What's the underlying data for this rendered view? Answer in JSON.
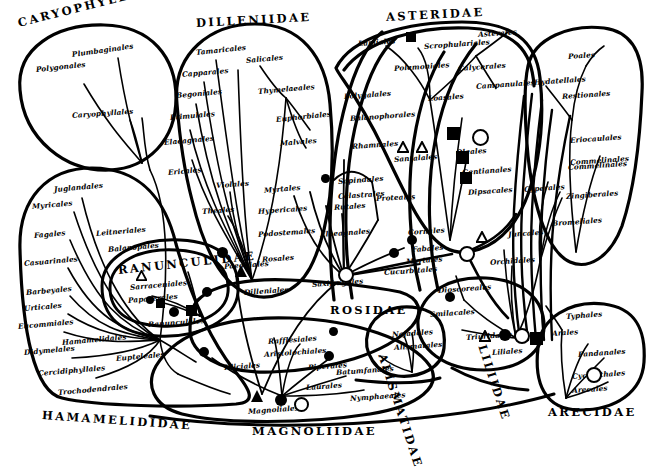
{
  "figure": {
    "type": "diagram",
    "kind": "phylogenetic-bubble-diagram",
    "background_color": "#ffffff",
    "ink_color": "#000000"
  },
  "subclasses": [
    {
      "label": "CARYOPHYLLIDAE",
      "x": 18,
      "y": 16,
      "rot": -14
    },
    {
      "label": "DILLENIIDAE",
      "x": 196,
      "y": 16,
      "rot": -3
    },
    {
      "label": "ASTERIDAE",
      "x": 386,
      "y": 10,
      "rot": -3
    },
    {
      "label": "RANUNCULIDAE",
      "x": 118,
      "y": 263,
      "rot": -6
    },
    {
      "label": "ROSIDAE",
      "x": 330,
      "y": 303,
      "rot": 0
    },
    {
      "label": "HAMAMELIDIDAE",
      "x": 42,
      "y": 408,
      "rot": 4
    },
    {
      "label": "MAGNOLIIDAE",
      "x": 252,
      "y": 424,
      "rot": 0
    },
    {
      "label": "ALISMATIDAE",
      "x": 382,
      "y": 347,
      "rot": 72
    },
    {
      "label": "LILIIDAE",
      "x": 482,
      "y": 338,
      "rot": 72
    },
    {
      "label": "ARECIDAE",
      "x": 548,
      "y": 405,
      "rot": 0
    }
  ],
  "orders": [
    {
      "label": "Plumbaginales",
      "x": 72,
      "y": 50,
      "rot": -8
    },
    {
      "label": "Polygonales",
      "x": 36,
      "y": 65,
      "rot": -6
    },
    {
      "label": "Caryophyllales",
      "x": 72,
      "y": 111,
      "rot": -4
    },
    {
      "label": "Tamaricales",
      "x": 196,
      "y": 48,
      "rot": -6
    },
    {
      "label": "Salicales",
      "x": 246,
      "y": 56,
      "rot": -5
    },
    {
      "label": "Capparales",
      "x": 182,
      "y": 70,
      "rot": -5
    },
    {
      "label": "Thymelaeales",
      "x": 258,
      "y": 87,
      "rot": -5
    },
    {
      "label": "Begoniales",
      "x": 176,
      "y": 91,
      "rot": -5
    },
    {
      "label": "Euphorbiales",
      "x": 276,
      "y": 115,
      "rot": -6
    },
    {
      "label": "Primulales",
      "x": 170,
      "y": 113,
      "rot": -5
    },
    {
      "label": "Malvales",
      "x": 280,
      "y": 139,
      "rot": -5
    },
    {
      "label": "Elaeagnales",
      "x": 164,
      "y": 138,
      "rot": -5
    },
    {
      "label": "Violales",
      "x": 216,
      "y": 181,
      "rot": -4
    },
    {
      "label": "Ericales",
      "x": 168,
      "y": 168,
      "rot": -5
    },
    {
      "label": "Theales",
      "x": 202,
      "y": 207,
      "rot": -4
    },
    {
      "label": "Paeoniales",
      "x": 224,
      "y": 262,
      "rot": -4
    },
    {
      "label": "Dilleniales",
      "x": 244,
      "y": 288,
      "rot": -4
    },
    {
      "label": "Myrtales",
      "x": 264,
      "y": 186,
      "rot": -5
    },
    {
      "label": "Hypericales",
      "x": 258,
      "y": 207,
      "rot": -4
    },
    {
      "label": "Podostemales",
      "x": 258,
      "y": 230,
      "rot": -4
    },
    {
      "label": "Rosales",
      "x": 262,
      "y": 255,
      "rot": -4
    },
    {
      "label": "Saxifragales",
      "x": 312,
      "y": 280,
      "rot": -4
    },
    {
      "label": "Rutales",
      "x": 334,
      "y": 203,
      "rot": -4
    },
    {
      "label": "Sapindales",
      "x": 338,
      "y": 177,
      "rot": -4
    },
    {
      "label": "Celastrales",
      "x": 338,
      "y": 192,
      "rot": -4
    },
    {
      "label": "Proteales",
      "x": 376,
      "y": 194,
      "rot": -3
    },
    {
      "label": "Elaeagnales",
      "x": 320,
      "y": 230,
      "rot": -4
    },
    {
      "label": "Cornales",
      "x": 408,
      "y": 228,
      "rot": -4
    },
    {
      "label": "Fabales",
      "x": 412,
      "y": 245,
      "rot": -4
    },
    {
      "label": "Myrtales",
      "x": 406,
      "y": 257,
      "rot": -4
    },
    {
      "label": "Cucurbitales",
      "x": 384,
      "y": 268,
      "rot": -4
    },
    {
      "label": "Lamiales",
      "x": 358,
      "y": 39,
      "rot": -4
    },
    {
      "label": "Scrophulariales",
      "x": 424,
      "y": 42,
      "rot": -4
    },
    {
      "label": "Asterales",
      "x": 478,
      "y": 30,
      "rot": -4
    },
    {
      "label": "Polemoniales",
      "x": 394,
      "y": 64,
      "rot": -4
    },
    {
      "label": "Calycerales",
      "x": 458,
      "y": 64,
      "rot": -4
    },
    {
      "label": "Campanulales",
      "x": 476,
      "y": 82,
      "rot": -4
    },
    {
      "label": "Loasales",
      "x": 428,
      "y": 94,
      "rot": -4
    },
    {
      "label": "Polygalales",
      "x": 344,
      "y": 92,
      "rot": -4
    },
    {
      "label": "Balanophorales",
      "x": 350,
      "y": 114,
      "rot": -4
    },
    {
      "label": "Rhamnales",
      "x": 352,
      "y": 142,
      "rot": -4
    },
    {
      "label": "Santalales",
      "x": 394,
      "y": 155,
      "rot": -4
    },
    {
      "label": "Oleales",
      "x": 456,
      "y": 148,
      "rot": -4
    },
    {
      "label": "Gentianales",
      "x": 462,
      "y": 168,
      "rot": -4
    },
    {
      "label": "Dipsacales",
      "x": 468,
      "y": 188,
      "rot": -4
    },
    {
      "label": "Juglandales",
      "x": 54,
      "y": 185,
      "rot": -5
    },
    {
      "label": "Myricales",
      "x": 32,
      "y": 202,
      "rot": -5
    },
    {
      "label": "Fagales",
      "x": 34,
      "y": 231,
      "rot": -5
    },
    {
      "label": "Leitneriales",
      "x": 96,
      "y": 229,
      "rot": -5
    },
    {
      "label": "Balanopales",
      "x": 108,
      "y": 245,
      "rot": -5
    },
    {
      "label": "Casuarinales",
      "x": 24,
      "y": 259,
      "rot": -5
    },
    {
      "label": "Barbeyales",
      "x": 26,
      "y": 288,
      "rot": -5
    },
    {
      "label": "Urticales",
      "x": 24,
      "y": 304,
      "rot": -5
    },
    {
      "label": "Eucommiales",
      "x": 18,
      "y": 322,
      "rot": -5
    },
    {
      "label": "Didymelales",
      "x": 24,
      "y": 348,
      "rot": -5
    },
    {
      "label": "Hamamelidales",
      "x": 62,
      "y": 338,
      "rot": -5
    },
    {
      "label": "Eupteleales",
      "x": 116,
      "y": 354,
      "rot": -5
    },
    {
      "label": "Cercidiphyllales",
      "x": 38,
      "y": 369,
      "rot": -5
    },
    {
      "label": "Trochodendrales",
      "x": 58,
      "y": 388,
      "rot": -5
    },
    {
      "label": "Sarraceniales",
      "x": 130,
      "y": 283,
      "rot": -5
    },
    {
      "label": "Papaverales",
      "x": 128,
      "y": 296,
      "rot": -5
    },
    {
      "label": "Ranunculales",
      "x": 148,
      "y": 320,
      "rot": -4
    },
    {
      "label": "Rafflesiales",
      "x": 268,
      "y": 337,
      "rot": -4
    },
    {
      "label": "Aristolochiales",
      "x": 264,
      "y": 350,
      "rot": -4
    },
    {
      "label": "Piperales",
      "x": 308,
      "y": 363,
      "rot": -4
    },
    {
      "label": "Batumfanales",
      "x": 336,
      "y": 368,
      "rot": -4
    },
    {
      "label": "Laurales",
      "x": 306,
      "y": 383,
      "rot": -4
    },
    {
      "label": "Illiciales",
      "x": 224,
      "y": 363,
      "rot": -4
    },
    {
      "label": "Nymphaeales",
      "x": 350,
      "y": 394,
      "rot": -4
    },
    {
      "label": "Magnoliales",
      "x": 248,
      "y": 407,
      "rot": -4
    },
    {
      "label": "Najadales",
      "x": 392,
      "y": 330,
      "rot": -4
    },
    {
      "label": "Alismatales",
      "x": 394,
      "y": 343,
      "rot": -4
    },
    {
      "label": "Dioscoreales",
      "x": 438,
      "y": 286,
      "rot": -4
    },
    {
      "label": "Smilacales",
      "x": 430,
      "y": 310,
      "rot": -4
    },
    {
      "label": "Triuridales",
      "x": 466,
      "y": 333,
      "rot": -4
    },
    {
      "label": "Liliales",
      "x": 492,
      "y": 348,
      "rot": -4
    },
    {
      "label": "Juncales",
      "x": 508,
      "y": 230,
      "rot": -4
    },
    {
      "label": "Orchidales",
      "x": 490,
      "y": 258,
      "rot": -4
    },
    {
      "label": "Cyperales",
      "x": 524,
      "y": 185,
      "rot": -4
    },
    {
      "label": "Zingiberales",
      "x": 566,
      "y": 192,
      "rot": -4
    },
    {
      "label": "Bromeliales",
      "x": 552,
      "y": 219,
      "rot": -4
    },
    {
      "label": "Commelinales",
      "x": 568,
      "y": 163,
      "rot": -4
    },
    {
      "label": "Poales",
      "x": 568,
      "y": 52,
      "rot": -4
    },
    {
      "label": "Hydatellales",
      "x": 534,
      "y": 78,
      "rot": -4
    },
    {
      "label": "Restionales",
      "x": 562,
      "y": 92,
      "rot": -4
    },
    {
      "label": "Eriocaulales",
      "x": 570,
      "y": 136,
      "rot": -4
    },
    {
      "label": "Commelinales",
      "x": 570,
      "y": 158,
      "rot": -4
    },
    {
      "label": "Typhales",
      "x": 566,
      "y": 312,
      "rot": -4
    },
    {
      "label": "Arales",
      "x": 552,
      "y": 329,
      "rot": -4
    },
    {
      "label": "Pandanales",
      "x": 578,
      "y": 350,
      "rot": -4
    },
    {
      "label": "Cyclanthales",
      "x": 572,
      "y": 372,
      "rot": -4
    },
    {
      "label": "Arecales",
      "x": 572,
      "y": 386,
      "rot": -4
    }
  ],
  "markers": [
    {
      "shape": "circle",
      "x": 222,
      "y": 252,
      "size": 11
    },
    {
      "shape": "triangle",
      "x": 241,
      "y": 271,
      "size": 12
    },
    {
      "shape": "circle",
      "x": 207,
      "y": 292,
      "size": 10
    },
    {
      "shape": "square",
      "x": 191,
      "y": 310,
      "size": 11
    },
    {
      "shape": "circle",
      "x": 174,
      "y": 312,
      "size": 10
    },
    {
      "shape": "square",
      "x": 160,
      "y": 303,
      "size": 9
    },
    {
      "shape": "circle",
      "x": 150,
      "y": 300,
      "size": 8
    },
    {
      "shape": "triangle-open",
      "x": 141,
      "y": 272,
      "size": 11
    },
    {
      "shape": "circle",
      "x": 204,
      "y": 352,
      "size": 10
    },
    {
      "shape": "triangle",
      "x": 257,
      "y": 396,
      "size": 12
    },
    {
      "shape": "circle",
      "x": 281,
      "y": 400,
      "size": 12
    },
    {
      "shape": "ring",
      "x": 299,
      "y": 402,
      "size": 11
    },
    {
      "shape": "circle",
      "x": 333,
      "y": 331,
      "size": 9
    },
    {
      "shape": "circle",
      "x": 329,
      "y": 356,
      "size": 10
    },
    {
      "shape": "ring",
      "x": 344,
      "y": 273,
      "size": 12
    },
    {
      "shape": "circle",
      "x": 325,
      "y": 178,
      "size": 9
    },
    {
      "shape": "circle",
      "x": 412,
      "y": 240,
      "size": 10
    },
    {
      "shape": "circle",
      "x": 394,
      "y": 253,
      "size": 10
    },
    {
      "shape": "ring",
      "x": 465,
      "y": 252,
      "size": 12
    },
    {
      "shape": "triangle-open",
      "x": 403,
      "y": 145,
      "size": 12
    },
    {
      "shape": "triangle-open",
      "x": 422,
      "y": 145,
      "size": 12
    },
    {
      "shape": "square",
      "x": 453,
      "y": 133,
      "size": 13
    },
    {
      "shape": "ring",
      "x": 478,
      "y": 135,
      "size": 13
    },
    {
      "shape": "square",
      "x": 462,
      "y": 157,
      "size": 13
    },
    {
      "shape": "square",
      "x": 466,
      "y": 178,
      "size": 12
    },
    {
      "shape": "square",
      "x": 411,
      "y": 37,
      "size": 10
    },
    {
      "shape": "triangle-open",
      "x": 482,
      "y": 235,
      "size": 12
    },
    {
      "shape": "circle",
      "x": 450,
      "y": 297,
      "size": 10
    },
    {
      "shape": "triangle-open",
      "x": 485,
      "y": 334,
      "size": 12
    },
    {
      "shape": "circle",
      "x": 505,
      "y": 335,
      "size": 12
    },
    {
      "shape": "ring",
      "x": 520,
      "y": 334,
      "size": 12
    },
    {
      "shape": "square",
      "x": 536,
      "y": 338,
      "size": 13
    },
    {
      "shape": "ring",
      "x": 592,
      "y": 373,
      "size": 12
    }
  ],
  "bubbles": [
    {
      "name": "caryophyllidae-bubble"
    },
    {
      "name": "dilleniidae-bubble"
    },
    {
      "name": "asteridae-bubble"
    },
    {
      "name": "hamamelididae-bubble"
    },
    {
      "name": "ranunculidae-bubble"
    },
    {
      "name": "magnoliidae-bubble"
    },
    {
      "name": "rosidae-bubble"
    },
    {
      "name": "alismatidae-bubble"
    },
    {
      "name": "liliidae-bubble"
    },
    {
      "name": "arecidae-bubble"
    },
    {
      "name": "commelinidae-bubble"
    }
  ]
}
